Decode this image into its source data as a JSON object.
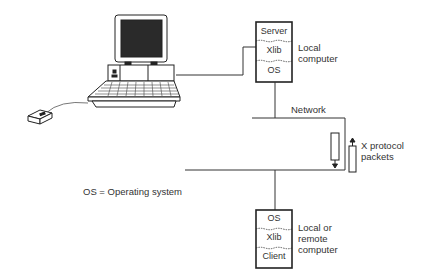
{
  "server_stack": {
    "layers": [
      "Server",
      "Xlib",
      "OS"
    ],
    "label_line1": "Local",
    "label_line2": "computer"
  },
  "client_stack": {
    "layers": [
      "OS",
      "Xlib",
      "Client"
    ],
    "label_line1": "Local or",
    "label_line2": "remote",
    "label_line3": "computer"
  },
  "network": {
    "label": "Network"
  },
  "packets": {
    "label_line1": "X protocol",
    "label_line2": "packets"
  },
  "legend": {
    "text": "OS = Operating system"
  },
  "icons": {
    "workstation": "computer-terminal-icon",
    "mouse": "mouse-icon"
  }
}
